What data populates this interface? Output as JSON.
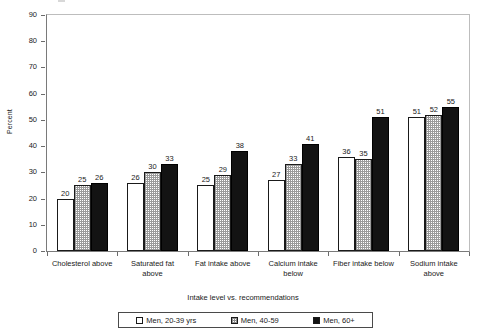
{
  "chart_data": {
    "type": "bar",
    "title": "",
    "subtitle": "",
    "xlabel": "Intake level vs. recommendations",
    "ylabel": "Percent",
    "ylim": [
      0,
      90
    ],
    "ytick_step": 10,
    "yticks": [
      "0",
      "10",
      "20",
      "30",
      "40",
      "50",
      "60",
      "70",
      "80",
      "90"
    ],
    "grid": false,
    "legend_position": "bottom",
    "categories": [
      "Cholesterol above",
      "Saturated fat above",
      "Fat intake above",
      "Calcium intake below",
      "Fiber intake below",
      "Sodium intake above"
    ],
    "category_lines": [
      [
        "Cholesterol above"
      ],
      [
        "Saturated fat",
        "above"
      ],
      [
        "Fat intake above"
      ],
      [
        "Calcium intake",
        "below"
      ],
      [
        "Fiber intake below"
      ],
      [
        "Sodium intake",
        "above"
      ]
    ],
    "series": [
      {
        "name": "Men, 20-39 yrs",
        "pattern": "open-white",
        "color": "#ffffff",
        "values": [
          20,
          26,
          25,
          27,
          36,
          51
        ]
      },
      {
        "name": "Men, 40-59",
        "pattern": "dotted-grey",
        "color": "#d9d9d9",
        "values": [
          25,
          30,
          29,
          33,
          35,
          52
        ]
      },
      {
        "name": "Men, 60+",
        "pattern": "solid-black",
        "color": "#131313",
        "values": [
          26,
          33,
          38,
          41,
          51,
          55
        ]
      }
    ]
  },
  "legend": {
    "items": [
      {
        "label": "Men, 20-39 yrs"
      },
      {
        "label": "Men, 40-59"
      },
      {
        "label": "Men, 60+"
      }
    ]
  }
}
